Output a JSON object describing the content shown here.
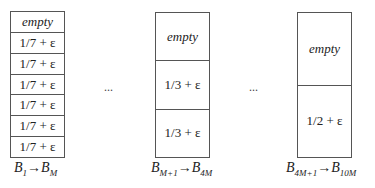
{
  "bins": [
    {
      "id": "group1",
      "cells": [
        "empty",
        "1/7 + ε",
        "1/7 + ε",
        "1/7 + ε",
        "1/7 + ε",
        "1/7 + ε",
        "1/7 + ε"
      ],
      "label": {
        "from_base": "B",
        "from_sub": "1",
        "arrow": "→",
        "to_base": "B",
        "to_sub": "M"
      }
    },
    {
      "id": "group2",
      "cells": [
        "empty",
        "1/3 + ε",
        "1/3 + ε"
      ],
      "label": {
        "from_base": "B",
        "from_sub": "M+1",
        "arrow": "→",
        "to_base": "B",
        "to_sub": "4M"
      }
    },
    {
      "id": "group3",
      "cells": [
        "empty",
        "1/2 + ε"
      ],
      "label": {
        "from_base": "B",
        "from_sub": "4M+1",
        "arrow": "→",
        "to_base": "B",
        "to_sub": "10M"
      }
    }
  ],
  "ellipses": [
    "...",
    "..."
  ]
}
